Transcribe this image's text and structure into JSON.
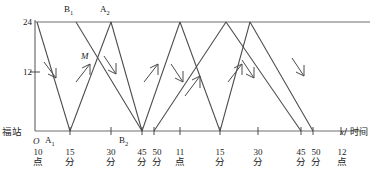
{
  "diagram": {
    "type": "train-schedule-distance-time-graph",
    "stroke_color": "#4a4a4a",
    "axis_color": "#6e6e6e",
    "background": "#ffffff",
    "origin_label": "O",
    "y_axis": {
      "ticks": [
        {
          "value": "12",
          "y_px": 72
        },
        {
          "value": "24",
          "y_px": 22
        }
      ],
      "station_label": "福站",
      "baseline_value": "0"
    },
    "x_axis": {
      "label_italic": "x",
      "label_rest": "/ 时间",
      "ticks": [
        {
          "num": "10",
          "cn": "点",
          "x_px": 38
        },
        {
          "num": "15",
          "cn": "分",
          "x_px": 70
        },
        {
          "num": "30",
          "cn": "分",
          "x_px": 111
        },
        {
          "num": "45",
          "cn": "分",
          "x_px": 142
        },
        {
          "num": "50",
          "cn": "分",
          "x_px": 154
        },
        {
          "num": "11",
          "cn": "点",
          "x_px": 180
        },
        {
          "num": "15",
          "cn": "分",
          "x_px": 220
        },
        {
          "num": "30",
          "cn": "分",
          "x_px": 258
        },
        {
          "num": "45",
          "cn": "分",
          "x_px": 301
        },
        {
          "num": "50",
          "cn": "分",
          "x_px": 313
        },
        {
          "num": "12",
          "cn": "点",
          "x_px": 341
        }
      ]
    },
    "point_labels": [
      {
        "name": "B",
        "sub": "1",
        "x_px": 68,
        "y_px": 8
      },
      {
        "name": "A",
        "sub": "2",
        "x_px": 104,
        "y_px": 8
      },
      {
        "name": "M",
        "sub": "",
        "x_px": 84,
        "y_px": 55
      },
      {
        "name": "A",
        "sub": "1",
        "x_px": 48,
        "y_px": 138
      },
      {
        "name": "B",
        "sub": "2",
        "x_px": 122,
        "y_px": 138
      }
    ]
  }
}
